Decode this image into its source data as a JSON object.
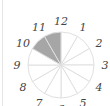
{
  "diagram": {
    "type": "clock-fraction-circle",
    "sectors": 12,
    "shaded_sectors": [
      11,
      12
    ],
    "shade_color": "#a6a6a6",
    "line_color": "#e0e0e0",
    "labels": [
      "12",
      "1",
      "2",
      "3",
      "4",
      "5",
      "6",
      "7",
      "8",
      "9",
      "10",
      "11"
    ]
  }
}
